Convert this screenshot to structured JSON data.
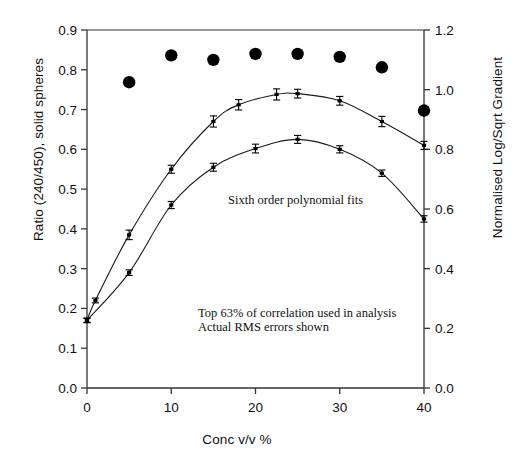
{
  "chart_data": {
    "type": "line",
    "title": "",
    "xlabel": "Conc v/v %",
    "ylabel": "Ratio (240/450), solid spheres",
    "ylabel_right": "Normalised Log/Sqrt Gradient",
    "xlim": [
      0,
      40
    ],
    "ylim": [
      0.0,
      0.9
    ],
    "ylim_right": [
      0.0,
      1.2
    ],
    "grid": false,
    "legend": "none",
    "xticks": [
      "0",
      "10",
      "20",
      "30",
      "40"
    ],
    "xtick_values": [
      0,
      10,
      20,
      30,
      40
    ],
    "yticks": [
      "0.0",
      "0.1",
      "0.2",
      "0.3",
      "0.4",
      "0.5",
      "0.6",
      "0.7",
      "0.8",
      "0.9"
    ],
    "ytick_values": [
      0.0,
      0.1,
      0.2,
      0.3,
      0.4,
      0.5,
      0.6,
      0.7,
      0.8,
      0.9
    ],
    "yticks_right": [
      "0.0",
      "0.2",
      "0.4",
      "0.6",
      "0.8",
      "1.0",
      "1.2"
    ],
    "ytick_values_right": [
      0.0,
      0.2,
      0.4,
      0.6,
      0.8,
      1.0,
      1.2
    ],
    "annotations": [
      "Sixth order polynomial fits",
      "Top 63% of correlation used in analysis",
      "Actual RMS errors shown"
    ],
    "series": [
      {
        "name": "Ratio (240/450), solid spheres",
        "marker": "filled-circle",
        "axis": "right",
        "line": false,
        "x": [
          5,
          10,
          15,
          20,
          25,
          30,
          35,
          40
        ],
        "values": [
          1.025,
          1.115,
          1.1,
          1.12,
          1.12,
          1.11,
          1.075,
          0.93
        ]
      },
      {
        "name": "Upper polynomial fit",
        "marker": "error-bar",
        "axis": "left",
        "line": true,
        "x": [
          0,
          1,
          5,
          10,
          15,
          18,
          22.5,
          25,
          30,
          35,
          40
        ],
        "values": [
          0.17,
          0.22,
          0.385,
          0.55,
          0.67,
          0.712,
          0.738,
          0.74,
          0.722,
          0.67,
          0.61
        ],
        "errors": [
          0.006,
          0.006,
          0.012,
          0.01,
          0.014,
          0.013,
          0.014,
          0.011,
          0.011,
          0.013,
          0.01
        ]
      },
      {
        "name": "Lower polynomial fit",
        "marker": "error-bar",
        "axis": "left",
        "line": true,
        "x": [
          0,
          5,
          10,
          15,
          20,
          25,
          30,
          35,
          40
        ],
        "values": [
          0.17,
          0.29,
          0.46,
          0.555,
          0.602,
          0.625,
          0.6,
          0.54,
          0.425
        ],
        "errors": [
          0.005,
          0.007,
          0.009,
          0.01,
          0.011,
          0.01,
          0.009,
          0.008,
          0.008
        ]
      }
    ]
  },
  "axes": {
    "xlabel": "Conc v/v %",
    "ylabel_left": "Ratio (240/450), solid spheres",
    "ylabel_right": "Normalised Log/Sqrt Gradient"
  },
  "annotations": {
    "fit_note": "Sixth order polynomial fits",
    "analysis_note_line1": "Top 63% of correlation used in analysis",
    "analysis_note_line2": "Actual RMS errors shown"
  },
  "caption": {
    "text": ""
  },
  "colors": {
    "line": "#1a1a1a",
    "marker": "#000000",
    "axis": "#333333",
    "background": "#ffffff"
  }
}
